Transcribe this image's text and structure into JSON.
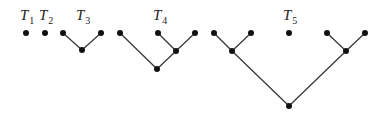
{
  "diagram": {
    "title": "",
    "trees": [
      {
        "label": "T",
        "sub": "1",
        "label_pos": [
          20,
          20
        ],
        "nodes": [
          [
            26,
            33
          ]
        ],
        "edges": []
      },
      {
        "label": "T",
        "sub": "2",
        "label_pos": [
          39,
          20
        ],
        "nodes": [
          [
            45,
            33
          ]
        ],
        "edges": []
      },
      {
        "label": "T",
        "sub": "3",
        "label_pos": [
          76,
          20
        ],
        "nodes": [
          [
            63,
            33
          ],
          [
            101,
            33
          ],
          [
            82,
            50
          ]
        ],
        "edges": [
          [
            0,
            2
          ],
          [
            1,
            2
          ]
        ]
      },
      {
        "label": "T",
        "sub": "4",
        "label_pos": [
          153,
          20
        ],
        "nodes": [
          [
            120,
            33
          ],
          [
            158,
            33
          ],
          [
            195,
            33
          ],
          [
            176,
            51
          ],
          [
            157,
            69
          ]
        ],
        "edges": [
          [
            1,
            3
          ],
          [
            2,
            3
          ],
          [
            3,
            4
          ],
          [
            0,
            4
          ]
        ]
      },
      {
        "label": "T",
        "sub": "5",
        "label_pos": [
          283,
          20
        ],
        "nodes": [
          [
            214,
            33
          ],
          [
            251,
            33
          ],
          [
            289,
            33
          ],
          [
            327,
            33
          ],
          [
            365,
            33
          ],
          [
            232,
            51
          ],
          [
            346,
            51
          ],
          [
            289,
            106
          ]
        ],
        "edges": [
          [
            0,
            5
          ],
          [
            1,
            5
          ],
          [
            3,
            6
          ],
          [
            4,
            6
          ],
          [
            5,
            7
          ],
          [
            6,
            7
          ]
        ]
      }
    ]
  }
}
